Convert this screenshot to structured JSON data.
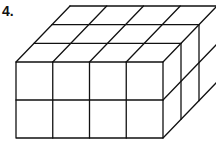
{
  "problem": {
    "number_label": "4.",
    "figure": "rectangular prism made of unit cubes",
    "dimensions": {
      "length": 4,
      "depth": 3,
      "height": 2
    },
    "colors": {
      "stroke": "#111111",
      "background": "#ffffff"
    }
  }
}
